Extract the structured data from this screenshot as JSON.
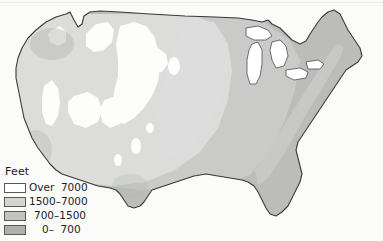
{
  "figure": {
    "kind": "physical-relief-map",
    "region": "Contiguous United States",
    "background_color": "#fbfbfa"
  },
  "legend": {
    "title": "Feet",
    "rows": [
      {
        "label": "Over  7000",
        "color": "#ffffff",
        "border": "#58585a",
        "min": 7000,
        "max": null
      },
      {
        "label": "1500–7000",
        "color": "#d4d5d3",
        "border": "#58585a",
        "min": 1500,
        "max": 7000
      },
      {
        "label": "700–1500",
        "color": "#c2c3c1",
        "border": "#58585a",
        "min": 700,
        "max": 1500
      },
      {
        "label": "0–  700",
        "color": "#b0b1af",
        "border": "#58585a",
        "min": 0,
        "max": 700
      }
    ]
  },
  "map_colors": {
    "outline": "#3a3a3a",
    "tier_over7000": "#fdfdfc",
    "tier_1500_7000": "#dcdddb",
    "tier_700_1500": "#cacbc9",
    "tier_0_700": "#bcbdbb",
    "shadow_tint": "#b4b5b3",
    "lake_fill": "#ffffff"
  }
}
